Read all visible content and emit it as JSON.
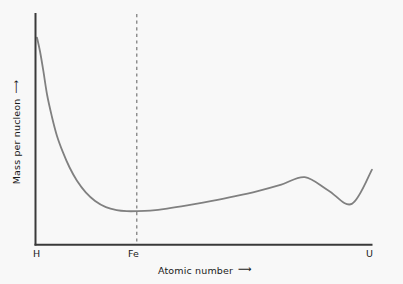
{
  "chart_data": {
    "type": "line",
    "title": "",
    "xlabel": "Atomic number",
    "ylabel": "Mass per nucleon",
    "xlabel_arrow": "⟶",
    "ylabel_arrow": "⟶",
    "grid": false,
    "legend": "none",
    "x_tick_labels": [
      "H",
      "Fe",
      "U"
    ],
    "x_tick_positions": [
      0,
      0.3,
      1.0
    ],
    "y_tick_labels": [],
    "xlim": [
      0,
      1
    ],
    "ylim": [
      0,
      1
    ],
    "annotations": [
      {
        "name": "fe-reference-line",
        "kind": "vertical-dashed-line",
        "x": 0.3,
        "label": "Fe"
      }
    ],
    "series": [
      {
        "name": "Mass per nucleon curve",
        "color": "#808080",
        "line_width": 1.8,
        "points": [
          [
            0.003,
            0.927
          ],
          [
            0.012,
            0.862
          ],
          [
            0.022,
            0.77
          ],
          [
            0.033,
            0.66
          ],
          [
            0.047,
            0.56
          ],
          [
            0.062,
            0.47
          ],
          [
            0.08,
            0.392
          ],
          [
            0.1,
            0.32
          ],
          [
            0.122,
            0.258
          ],
          [
            0.148,
            0.204
          ],
          [
            0.176,
            0.164
          ],
          [
            0.208,
            0.135
          ],
          [
            0.24,
            0.121
          ],
          [
            0.27,
            0.116
          ],
          [
            0.3,
            0.116
          ],
          [
            0.34,
            0.119
          ],
          [
            0.39,
            0.128
          ],
          [
            0.45,
            0.143
          ],
          [
            0.52,
            0.163
          ],
          [
            0.59,
            0.185
          ],
          [
            0.66,
            0.21
          ],
          [
            0.73,
            0.24
          ],
          [
            0.8,
            0.275
          ],
          [
            0.87,
            0.213
          ],
          [
            0.94,
            0.15
          ],
          [
            1.0,
            0.31
          ]
        ]
      }
    ],
    "axes": {
      "left_spine": true,
      "bottom_spine": true,
      "top_spine": false,
      "right_spine": false,
      "spine_color": "#3a3a3a"
    }
  },
  "figure": {
    "background_color": "#f8f8f8",
    "curve_color": "#808080",
    "axis_color": "#3a3a3a",
    "text_color": "#1a1a1a",
    "dash_color": "#6b6b6b"
  }
}
